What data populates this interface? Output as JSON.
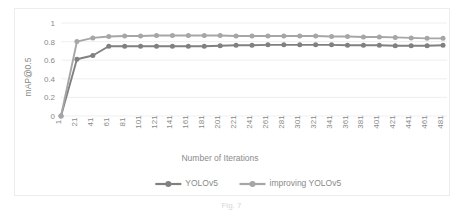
{
  "figure": {
    "caption": "Fig. 7"
  },
  "chart_data": {
    "type": "line",
    "title": "",
    "xlabel": "Number of Iterations",
    "ylabel": "mAP@0.5",
    "ylim": [
      0,
      1
    ],
    "yticks": [
      "0",
      "0.2",
      "0.4",
      "0.6",
      "0.8",
      "1"
    ],
    "ytick_values": [
      0,
      0.2,
      0.4,
      0.6,
      0.8,
      1
    ],
    "grid": true,
    "legend_position": "bottom",
    "categories": [
      "1",
      "21",
      "41",
      "61",
      "81",
      "101",
      "121",
      "141",
      "161",
      "181",
      "201",
      "221",
      "241",
      "261",
      "281",
      "301",
      "321",
      "341",
      "361",
      "381",
      "401",
      "421",
      "441",
      "461",
      "481"
    ],
    "series": [
      {
        "name": "YOLOv5",
        "color": "#808080",
        "values": [
          0.0,
          0.61,
          0.65,
          0.75,
          0.75,
          0.75,
          0.75,
          0.75,
          0.75,
          0.75,
          0.755,
          0.76,
          0.76,
          0.765,
          0.765,
          0.765,
          0.765,
          0.765,
          0.76,
          0.76,
          0.76,
          0.755,
          0.755,
          0.755,
          0.76
        ]
      },
      {
        "name": "improving YOLOv5",
        "color": "#a6a6a6",
        "values": [
          0.0,
          0.8,
          0.84,
          0.855,
          0.86,
          0.86,
          0.865,
          0.865,
          0.865,
          0.865,
          0.865,
          0.86,
          0.86,
          0.86,
          0.86,
          0.86,
          0.86,
          0.855,
          0.855,
          0.85,
          0.85,
          0.845,
          0.84,
          0.835,
          0.835
        ]
      }
    ]
  }
}
